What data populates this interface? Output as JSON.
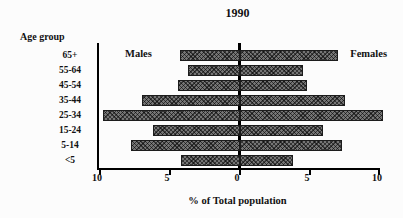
{
  "chart_data": {
    "type": "bar",
    "subtype": "population-pyramid",
    "title": "1990",
    "ylabel": "Age group",
    "xlabel": "% of Total population",
    "categories": [
      "65+",
      "55-64",
      "45-54",
      "35-44",
      "25-34",
      "15-24",
      "5-14",
      "<5"
    ],
    "series": [
      {
        "name": "Males",
        "side": "left",
        "values": [
          4.3,
          3.7,
          4.4,
          7.0,
          9.8,
          6.2,
          7.8,
          4.2
        ]
      },
      {
        "name": "Females",
        "side": "right",
        "values": [
          7.0,
          4.5,
          4.8,
          7.5,
          10.2,
          5.9,
          7.3,
          3.8
        ]
      }
    ],
    "x_ticks": [
      "10",
      "5",
      "0",
      "5",
      "10"
    ],
    "xlim_each_side": [
      0,
      10
    ],
    "grid": "off",
    "legend_position": "inside-top (Males left, Females right)",
    "bar_color": "#757575",
    "bar_pattern": "crosshatch",
    "axis_color": "#000000",
    "background_color": "#fcfcfc"
  }
}
